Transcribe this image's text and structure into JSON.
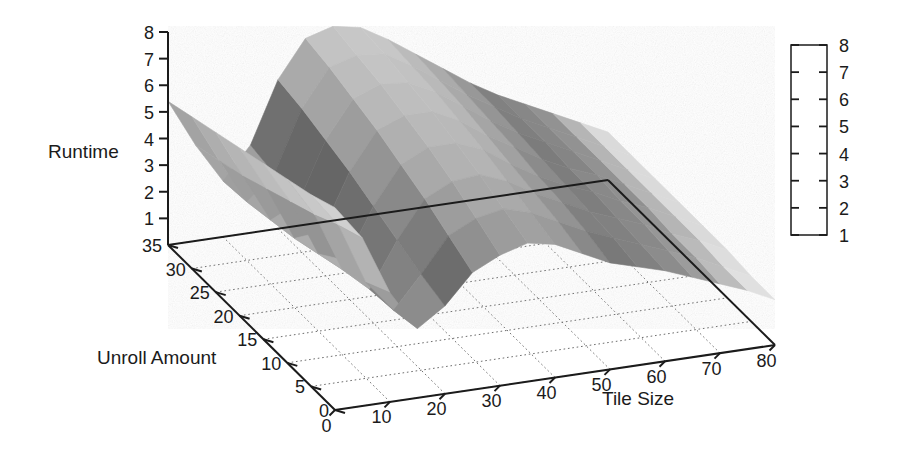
{
  "figure": {
    "background_color": "#ffffff",
    "width": 901,
    "height": 469
  },
  "chart_data": {
    "type": "surface",
    "title": "",
    "subtitle": "",
    "xlabel": "Tile Size",
    "ylabel": "Unroll Amount",
    "zlabel": "Runtime",
    "grid": true,
    "legend_position": "right",
    "projection": "3d",
    "xlim": [
      0,
      80
    ],
    "ylim": [
      0,
      35
    ],
    "zlim": [
      0,
      8
    ],
    "xticks": [
      0,
      10,
      20,
      30,
      40,
      50,
      60,
      70,
      80
    ],
    "yticks": [
      0,
      5,
      10,
      15,
      20,
      25,
      30,
      35
    ],
    "zticks": [
      1,
      2,
      3,
      4,
      5,
      6,
      7,
      8
    ],
    "xticklabels": [
      "0",
      "10",
      "20",
      "30",
      "40",
      "50",
      "60",
      "70",
      "80"
    ],
    "yticklabels": [
      "0",
      "5",
      "10",
      "15",
      "20",
      "25",
      "30",
      "35"
    ],
    "zticklabels": [
      "1",
      "2",
      "3",
      "4",
      "5",
      "6",
      "7",
      "8"
    ],
    "colorbar": {
      "ticks": [
        1,
        2,
        3,
        4,
        5,
        6,
        7,
        8
      ],
      "ticklabels": [
        "1",
        "2",
        "3",
        "4",
        "5",
        "6",
        "7",
        "8"
      ],
      "vmin": 1,
      "vmax": 8,
      "colormap": "grayscale-nonmonotonic",
      "stops": [
        {
          "value": 1,
          "color": "#f7f7f7"
        },
        {
          "value": 2,
          "color": "#d9d9d9"
        },
        {
          "value": 3,
          "color": "#8e8e8e"
        },
        {
          "value": 4,
          "color": "#787878"
        },
        {
          "value": 5,
          "color": "#9d9d9d"
        },
        {
          "value": 6,
          "color": "#b4b4b4"
        },
        {
          "value": 7,
          "color": "#c6c6c6"
        },
        {
          "value": 8,
          "color": "#d2d2d2"
        }
      ]
    },
    "x": [
      0,
      5,
      10,
      15,
      20,
      25,
      30,
      35,
      40,
      45,
      50,
      55,
      60,
      65,
      70,
      75,
      80
    ],
    "y": [
      0,
      5,
      10,
      15,
      20,
      25,
      30,
      35
    ],
    "z": [
      [
        7.6,
        6.3,
        4.1,
        2.6,
        3.3,
        4.4,
        4.9,
        5.2,
        5.0,
        4.5,
        4.0,
        3.7,
        3.4,
        3.0,
        2.6,
        2.2,
        1.7
      ],
      [
        7.2,
        5.9,
        3.6,
        2.4,
        3.6,
        4.9,
        5.4,
        5.6,
        5.3,
        4.8,
        4.3,
        3.9,
        3.5,
        3.1,
        2.7,
        2.2,
        1.7
      ],
      [
        6.9,
        5.4,
        3.2,
        2.3,
        4.0,
        5.4,
        5.9,
        6.0,
        5.6,
        5.0,
        4.5,
        4.0,
        3.6,
        3.2,
        2.7,
        2.3,
        1.8
      ],
      [
        6.6,
        5.0,
        2.9,
        2.5,
        4.4,
        5.8,
        6.3,
        6.3,
        5.9,
        5.2,
        4.6,
        4.1,
        3.7,
        3.2,
        2.8,
        2.3,
        1.8
      ],
      [
        6.3,
        4.6,
        2.6,
        2.7,
        4.8,
        6.2,
        6.6,
        6.6,
        6.1,
        5.4,
        4.8,
        4.2,
        3.7,
        3.3,
        2.8,
        2.3,
        1.8
      ],
      [
        6.0,
        4.2,
        2.4,
        2.9,
        5.1,
        6.5,
        6.9,
        6.8,
        6.3,
        5.6,
        4.9,
        4.3,
        3.8,
        3.3,
        2.8,
        2.3,
        1.8
      ],
      [
        5.7,
        3.9,
        2.2,
        3.1,
        5.4,
        6.8,
        7.1,
        7.0,
        6.4,
        5.7,
        5.0,
        4.4,
        3.8,
        3.3,
        2.8,
        2.3,
        1.8
      ],
      [
        5.4,
        3.6,
        2.1,
        3.3,
        5.6,
        7.0,
        7.3,
        7.1,
        6.5,
        5.8,
        5.1,
        4.4,
        3.8,
        3.3,
        2.8,
        2.3,
        1.8
      ]
    ]
  },
  "view": {
    "origin_px": [
      335,
      410
    ],
    "x_corner_px": [
      775,
      345
    ],
    "y_corner_px": [
      168,
      245
    ],
    "z_top_px": [
      168,
      32
    ],
    "z_axis_bottom_px": [
      168,
      245
    ]
  },
  "colorbar_box": {
    "x": 791,
    "y": 45,
    "width": 36,
    "height": 190
  }
}
